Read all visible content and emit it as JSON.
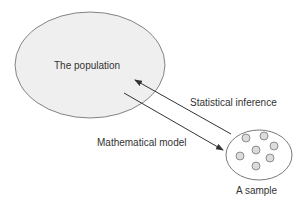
{
  "diagram": {
    "population": {
      "label": "The population",
      "fill": "#efefef",
      "stroke": "#555555"
    },
    "sample": {
      "label": "A sample",
      "fill": "#ffffff",
      "stroke": "#555555",
      "dot_fill": "#dcdcdc",
      "dot_count": 7
    },
    "arrows": [
      {
        "label": "Statistical inference",
        "direction": "sample-to-population"
      },
      {
        "label": "Mathematical model",
        "direction": "population-to-sample"
      }
    ],
    "colors": {
      "line": "#333333",
      "text": "#333333"
    }
  }
}
